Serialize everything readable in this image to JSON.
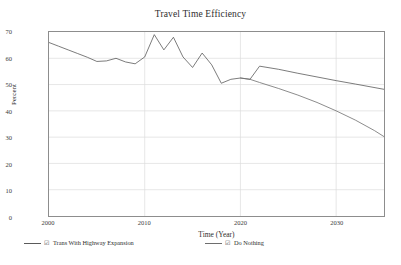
{
  "chart_data": {
    "type": "line",
    "title": "Travel Time Efficiency",
    "xlabel": "Time (Year)",
    "ylabel": "Percent",
    "xlim": [
      2000,
      2035
    ],
    "ylim": [
      0,
      70
    ],
    "xticks": [
      2000,
      2010,
      2020,
      2030
    ],
    "yticks": [
      0,
      10,
      20,
      30,
      40,
      50,
      60,
      70
    ],
    "grid": true,
    "legend_position": "bottom",
    "series": [
      {
        "name": "Trans With Highway Expansion",
        "color": "#5a5a5a",
        "x": [
          2000,
          2001,
          2002,
          2003,
          2004,
          2005,
          2006,
          2007,
          2008,
          2009,
          2010,
          2011,
          2012,
          2013,
          2014,
          2015,
          2016,
          2017,
          2018,
          2019,
          2020,
          2021,
          2022,
          2024,
          2026,
          2028,
          2030,
          2032,
          2035
        ],
        "values": [
          66.0,
          64.6,
          63.2,
          61.8,
          60.4,
          58.8,
          59.0,
          60.0,
          58.6,
          57.9,
          60.5,
          69.0,
          63.2,
          68.0,
          60.5,
          56.5,
          62.0,
          57.5,
          50.5,
          52.0,
          52.5,
          52.0,
          57.0,
          55.8,
          54.3,
          52.9,
          51.5,
          50.2,
          48.2
        ]
      },
      {
        "name": "Do Nothing",
        "color": "#6e6e6e",
        "x": [
          2020,
          2021,
          2022,
          2024,
          2026,
          2028,
          2030,
          2032,
          2034,
          2035
        ],
        "values": [
          52.5,
          52.0,
          50.8,
          48.5,
          46.0,
          43.2,
          40.0,
          36.5,
          32.5,
          30.2
        ]
      }
    ],
    "annotations": [
      "Historical series 2000-2020 is volatile, peaking near 69 percent around 2011 and 2013",
      "Both scenarios share history through 2021, then the highway expansion scenario steps up to about 57 percent in 2022",
      "Do Nothing declines steadily to about 30 percent by 2035"
    ]
  },
  "legend": {
    "glyph": "☑",
    "entries": [
      {
        "label": "Trans With Highway Expansion"
      },
      {
        "label": "Do Nothing"
      }
    ]
  }
}
